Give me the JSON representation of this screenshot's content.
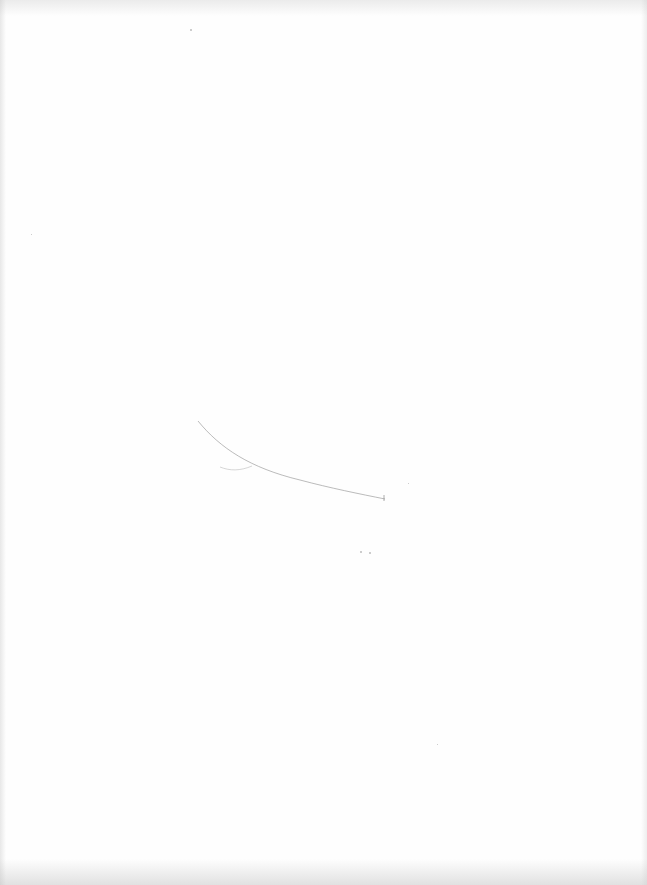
{
  "document": {
    "type": "scanned blank page",
    "content": "",
    "marks": [
      {
        "kind": "pencil-stroke",
        "description": "faint curved line"
      },
      {
        "kind": "pencil-stroke",
        "description": "short faint hook"
      }
    ],
    "colors": {
      "paper": "#fefefe",
      "pencil": "#9a9a9a",
      "scan-noise": "#bdbdbd"
    }
  }
}
